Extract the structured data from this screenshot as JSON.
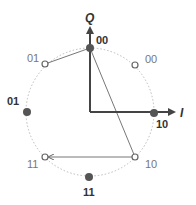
{
  "diagram": {
    "title": "",
    "type": "constellation",
    "axes": {
      "q_label": "Q",
      "i_label": "I"
    },
    "colors": {
      "axis": "#444444",
      "filled_point": "#555555",
      "open_point": "#666666",
      "circle": "#bbbbbb",
      "transition_line": "#666666"
    },
    "filled_points": [
      {
        "label": "00",
        "position": "top"
      },
      {
        "label": "01",
        "position": "left"
      },
      {
        "label": "10",
        "position": "right"
      },
      {
        "label": "11",
        "position": "bottom"
      }
    ],
    "open_points": [
      {
        "label": "00",
        "position": "upper-right"
      },
      {
        "label": "01",
        "position": "upper-left"
      },
      {
        "label": "10",
        "position": "lower-right"
      },
      {
        "label": "11",
        "position": "lower-left"
      }
    ],
    "transitions": [
      {
        "from": "01 (upper-left, open)",
        "to": "00 (top, filled)"
      },
      {
        "from": "00 (top, filled)",
        "to": "10 (lower-right, open)"
      },
      {
        "from": "10 (lower-right, open)",
        "to": "11 (lower-left, open)"
      }
    ]
  }
}
